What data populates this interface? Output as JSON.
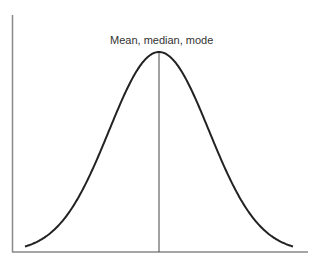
{
  "diagram": {
    "annotation": "Mean, median, mode",
    "curve": {
      "type": "normal",
      "center_x": 159,
      "peak_y": 52,
      "baseline_y": 252,
      "sigma_px": 50,
      "x_start": 25,
      "x_end": 293
    },
    "colors": {
      "curve": "#222222",
      "axes": "#888888",
      "center_line": "#444444",
      "text": "#333333"
    }
  }
}
